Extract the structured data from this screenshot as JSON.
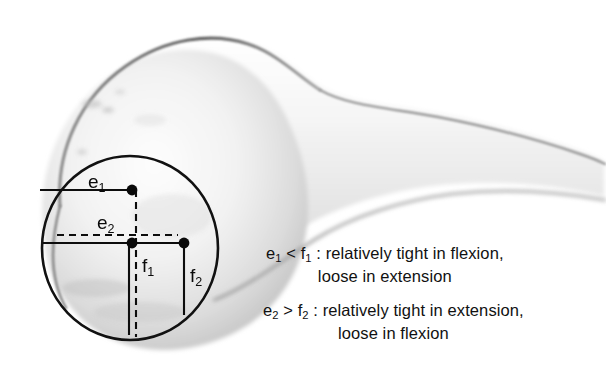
{
  "figure": {
    "kind": "anatomical-diagram",
    "background_color": "#ffffff",
    "ink_color": "#0a0a0a"
  },
  "geometry": {
    "circle": {
      "cx": 130,
      "cy": 248,
      "rx": 88,
      "ry": 92,
      "stroke": "#111111",
      "stroke_width": 2.6
    },
    "points": [
      {
        "name": "e1-endpoint",
        "x": 132,
        "y": 190
      },
      {
        "name": "center-point",
        "x": 132,
        "y": 243
      },
      {
        "name": "f2-endpoint",
        "x": 184,
        "y": 243
      }
    ],
    "segments": [
      {
        "name": "e1-horizontal",
        "style": "solid",
        "x1": 40,
        "y1": 190,
        "x2": 132,
        "y2": 190
      },
      {
        "name": "e2-horizontal-dashed",
        "style": "dashed",
        "x1": 57,
        "y1": 235,
        "x2": 178,
        "y2": 235
      },
      {
        "name": "center-horizontal",
        "style": "solid",
        "x1": 43,
        "y1": 243,
        "x2": 184,
        "y2": 243
      },
      {
        "name": "f1-vertical-dashed",
        "style": "dashed",
        "x1": 136,
        "y1": 190,
        "x2": 136,
        "y2": 336
      },
      {
        "name": "f1-vertical-solid",
        "style": "solid",
        "x1": 130,
        "y1": 243,
        "x2": 130,
        "y2": 334
      },
      {
        "name": "f2-vertical-solid",
        "style": "solid",
        "x1": 184,
        "y1": 243,
        "x2": 184,
        "y2": 314
      }
    ]
  },
  "labels": {
    "e1": {
      "base": "e",
      "sub": "1"
    },
    "e2": {
      "base": "e",
      "sub": "2"
    },
    "f1": {
      "base": "f",
      "sub": "1"
    },
    "f2": {
      "base": "f",
      "sub": "2"
    }
  },
  "captions": [
    {
      "id": "caption-1",
      "line1_parts": [
        "e",
        "1",
        " < f",
        "1",
        " : relatively tight in flexion,"
      ],
      "line1_plain": "e1 < f1 : relatively tight in flexion,",
      "line2": "loose in extension"
    },
    {
      "id": "caption-2",
      "line1_parts": [
        "e",
        "2",
        " > f",
        "2",
        " : relatively tight in extension,"
      ],
      "line1_plain": "e2 > f2 : relatively tight in extension,",
      "line2": "loose in flexion"
    }
  ],
  "caption_text": {
    "c1_e": "e",
    "c1_e_sub": "1",
    "c1_mid": " < f",
    "c1_f_sub": "1",
    "c1_tail": " : relatively tight in flexion,",
    "c1_line2": "loose in extension",
    "c2_e": "e",
    "c2_e_sub": "2",
    "c2_mid": " > f",
    "c2_f_sub": "2",
    "c2_tail": " : relatively tight in extension,",
    "c2_line2": "loose in flexion"
  }
}
